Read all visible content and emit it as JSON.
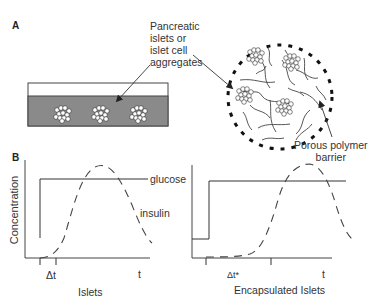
{
  "panel_a": {
    "letter": "A",
    "islets_label": [
      "Pancreatic",
      "islets or",
      "islet cell",
      "aggregates"
    ],
    "barrier_label": [
      "Porous polymer",
      "barrier"
    ]
  },
  "panel_b": {
    "letter": "B",
    "y_axis_label": "Concentration",
    "glucose_label": "glucose",
    "insulin_label": "insulin",
    "left_plot": {
      "title": "Islets",
      "delta_label": "Δt",
      "t_label": "t"
    },
    "right_plot": {
      "title": "Encapsulated Islets",
      "delta_label": "Δt*",
      "t_label": "t"
    }
  },
  "colors": {
    "medium_gray": "#8a8a8a",
    "line": "#333333"
  }
}
